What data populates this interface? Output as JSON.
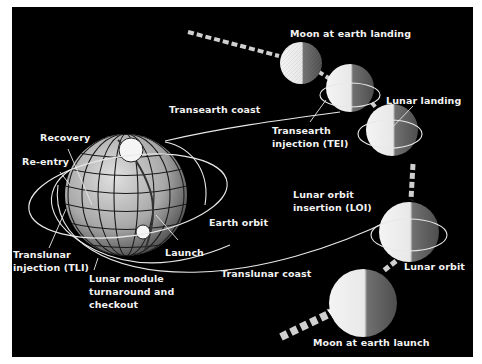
{
  "diagram": {
    "type": "lunar mission profile",
    "colors": {
      "background": "#000000",
      "frame": "#ffffff",
      "text": "#f2f2f2",
      "path": "#e8e8e8",
      "moon_lit": "#efefef",
      "moon_dark": "#6a6a6a",
      "earth": "#9a9a9a"
    },
    "labels": {
      "moon_at_earth_landing": "Moon at earth landing",
      "lunar_landing": "Lunar landing",
      "transearth_coast": "Transearth coast",
      "transearth_injection": "Transearth\ninjection (TEI)",
      "recovery": "Recovery",
      "re_entry": "Re-entry",
      "lunar_orbit_insertion": "Lunar orbit\ninsertion (LOI)",
      "earth_orbit": "Earth orbit",
      "launch": "Launch",
      "translunar_injection": "Translunar\ninjection (TLI)",
      "lunar_module_turnaround": "Lunar module\nturnaround and\ncheckout",
      "translunar_coast": "Translunar coast",
      "lunar_orbit": "Lunar orbit",
      "moon_at_earth_launch": "Moon at earth launch"
    },
    "nodes": [
      {
        "id": "earth",
        "name": "Earth"
      },
      {
        "id": "moon-launch",
        "name": "Moon at earth launch"
      },
      {
        "id": "moon-loi",
        "name": "Moon at lunar orbit insertion"
      },
      {
        "id": "moon-landing",
        "name": "Moon at lunar landing"
      },
      {
        "id": "moon-tei",
        "name": "Moon at transearth injection"
      },
      {
        "id": "moon-earth-landing",
        "name": "Moon at earth landing"
      }
    ],
    "edges": [
      {
        "from": "earth",
        "to": "moon-loi",
        "label": "Translunar coast"
      },
      {
        "from": "moon-tei",
        "to": "earth",
        "label": "Transearth coast"
      },
      {
        "from": "moon-launch",
        "to": "moon-earth-landing",
        "label": "Moon orbital motion"
      }
    ]
  }
}
